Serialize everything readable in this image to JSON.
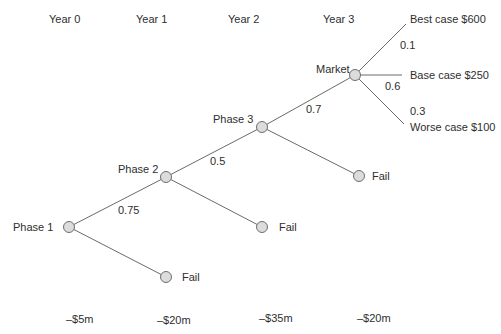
{
  "years": [
    {
      "label": "Year 0",
      "x": 49,
      "y": 14
    },
    {
      "label": "Year 1",
      "x": 136,
      "y": 14
    },
    {
      "label": "Year 2",
      "x": 228,
      "y": 14
    },
    {
      "label": "Year 3",
      "x": 323,
      "y": 14
    }
  ],
  "costs": [
    {
      "label": "–$5m",
      "x": 66,
      "y": 314
    },
    {
      "label": "–$20m",
      "x": 157,
      "y": 315
    },
    {
      "label": "–$35m",
      "x": 259,
      "y": 313
    },
    {
      "label": "–$20m",
      "x": 357,
      "y": 313
    }
  ],
  "nodes": [
    {
      "id": "phase1",
      "label": "Phase 1",
      "cx": 69,
      "cy": 227,
      "lx": 13,
      "ly": 222
    },
    {
      "id": "phase2",
      "label": "Phase 2",
      "cx": 166,
      "cy": 177,
      "lx": 118,
      "ly": 164
    },
    {
      "id": "phase3",
      "label": "Phase 3",
      "cx": 262,
      "cy": 127,
      "lx": 213,
      "ly": 114
    },
    {
      "id": "market",
      "label": "Market",
      "cx": 355,
      "cy": 75,
      "lx": 316,
      "ly": 64
    },
    {
      "id": "fail1",
      "label": "Fail",
      "cx": 166,
      "cy": 277,
      "lx": 182,
      "ly": 272
    },
    {
      "id": "fail2",
      "label": "Fail",
      "cx": 262,
      "cy": 227,
      "lx": 279,
      "ly": 222
    },
    {
      "id": "fail3",
      "label": "Fail",
      "cx": 359,
      "cy": 176,
      "lx": 372,
      "ly": 171
    }
  ],
  "edges": [
    {
      "from": [
        69,
        227
      ],
      "to": [
        166,
        177
      ]
    },
    {
      "from": [
        69,
        227
      ],
      "to": [
        166,
        277
      ]
    },
    {
      "from": [
        166,
        177
      ],
      "to": [
        262,
        127
      ]
    },
    {
      "from": [
        166,
        177
      ],
      "to": [
        262,
        227
      ]
    },
    {
      "from": [
        262,
        127
      ],
      "to": [
        355,
        75
      ]
    },
    {
      "from": [
        262,
        127
      ],
      "to": [
        359,
        176
      ]
    },
    {
      "from": [
        355,
        75
      ],
      "to": [
        406,
        24
      ]
    },
    {
      "from": [
        355,
        75
      ],
      "to": [
        402,
        75
      ]
    },
    {
      "from": [
        355,
        75
      ],
      "to": [
        404,
        124
      ]
    }
  ],
  "probabilities": [
    {
      "label": "0.75",
      "x": 118,
      "y": 205
    },
    {
      "label": "0.5",
      "x": 210,
      "y": 156
    },
    {
      "label": "0.7",
      "x": 306,
      "y": 104
    },
    {
      "label": "0.1",
      "x": 400,
      "y": 40
    },
    {
      "label": "0.6",
      "x": 385,
      "y": 81
    },
    {
      "label": "0.3",
      "x": 410,
      "y": 106
    }
  ],
  "outcomes": [
    {
      "label": "Best case $600",
      "x": 410,
      "y": 14
    },
    {
      "label": "Base case $250",
      "x": 410,
      "y": 70
    },
    {
      "label": "Worse case $100",
      "x": 410,
      "y": 122
    }
  ],
  "style": {
    "line_color": "#6a6a6a",
    "node_fill": "#dcdcdc",
    "node_stroke": "#6e6e6e",
    "node_radius": 5.5
  }
}
